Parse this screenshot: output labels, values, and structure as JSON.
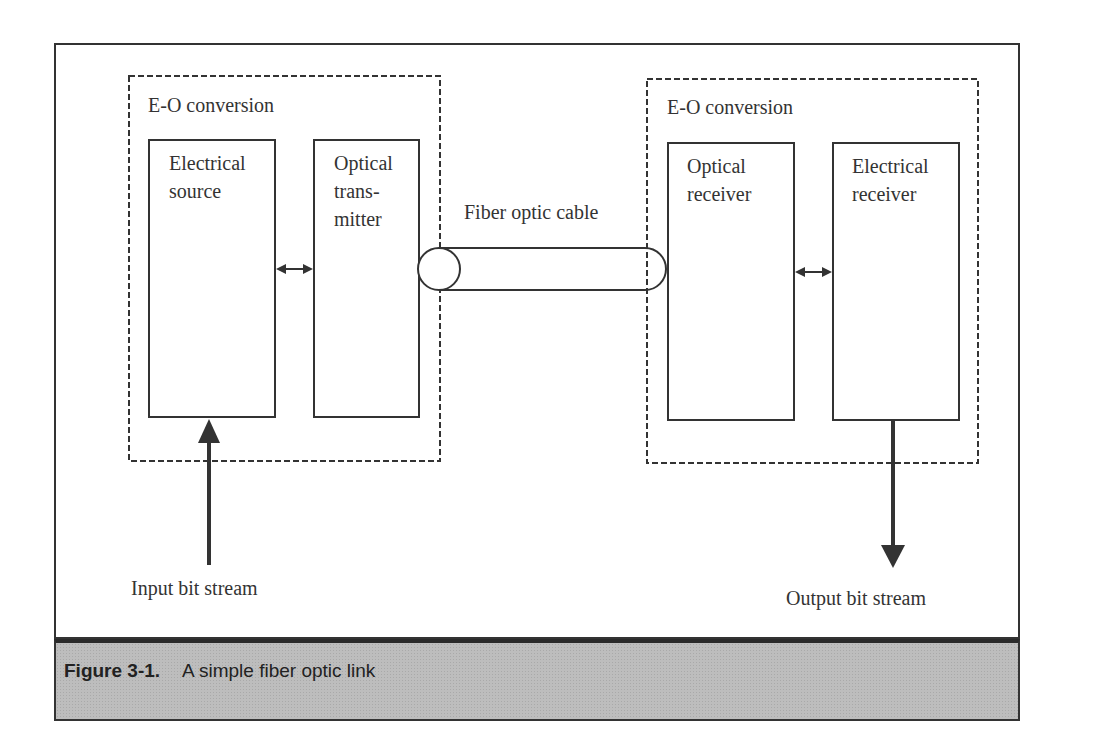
{
  "diagram": {
    "left_group": {
      "title": "E-O conversion",
      "blocks": [
        {
          "id": "electrical-source",
          "lines": [
            "Electrical",
            "source"
          ]
        },
        {
          "id": "optical-transmitter",
          "lines": [
            "Optical",
            "trans-",
            "mitter"
          ]
        }
      ]
    },
    "right_group": {
      "title": "E-O conversion",
      "blocks": [
        {
          "id": "optical-receiver",
          "lines": [
            "Optical",
            "receiver"
          ]
        },
        {
          "id": "electrical-receiver",
          "lines": [
            "Electrical",
            "receiver"
          ]
        }
      ]
    },
    "cable": {
      "label": "Fiber optic cable"
    },
    "input": {
      "label": "Input bit stream"
    },
    "output": {
      "label": "Output bit stream"
    }
  },
  "caption": {
    "number": "Figure 3-1.",
    "text": "A simple fiber optic link"
  },
  "colors": {
    "line": "#333333",
    "caption_bg": "#bdbdbd"
  }
}
